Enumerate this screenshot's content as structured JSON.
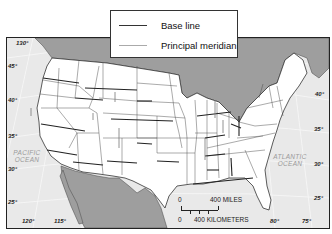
{
  "legend": {
    "items": [
      {
        "label": "Base line",
        "color": "#333333"
      },
      {
        "label": "Principal meridian",
        "color": "#aaaaaa"
      }
    ]
  },
  "graticule": {
    "longitudes": [
      "130°",
      "120°",
      "115°",
      "80°",
      "75°"
    ],
    "latitudes_west": [
      "45°",
      "40°",
      "35°",
      "30°",
      "25°"
    ],
    "latitudes_east": [
      "40°",
      "35°",
      "30°",
      "25°"
    ]
  },
  "oceans": {
    "pacific": [
      "PACIFIC",
      "OCEAN"
    ],
    "atlantic": [
      "ATLANTIC",
      "OCEAN"
    ]
  },
  "scale_bar": {
    "miles_zero": "0",
    "miles_label": "400 MILES",
    "km_zero": "0",
    "km_label": "400 KILOMETERS"
  },
  "colors": {
    "land_us": "#ffffff",
    "land_other": "#9e9e9e",
    "water": "#e9e9e9",
    "border": "#333333"
  }
}
